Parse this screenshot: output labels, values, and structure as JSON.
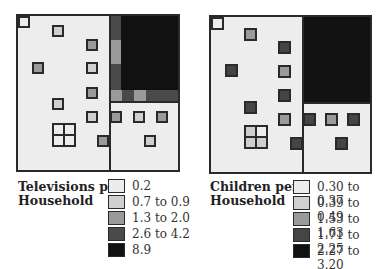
{
  "colors": {
    "tv": {
      "c1": "#ececec",
      "c2": "#cfcfcf",
      "c3": "#9a9a9a",
      "c4": "#4a4a4a",
      "c5": "#111111"
    },
    "children": {
      "c1": "#ececec",
      "c2": "#cfcfcf",
      "c3": "#9a9a9a",
      "c4": "#454545",
      "c5": "#111111"
    }
  },
  "left_map": {
    "legend_title_line1": "Televisions per",
    "legend_title_line2": "Household",
    "legend": [
      {
        "label": "0.2",
        "class": "c1"
      },
      {
        "label": "0.7 to 0.9",
        "class": "c2"
      },
      {
        "label": "1.3 to 2.0",
        "class": "c3"
      },
      {
        "label": "2.6 to 4.2",
        "class": "c4"
      },
      {
        "label": "8.9",
        "class": "c5"
      }
    ]
  },
  "right_map": {
    "legend_title_line1": "Children per",
    "legend_title_line2": "Household",
    "legend": [
      {
        "label": "0.30 to 0.37",
        "class": "c1"
      },
      {
        "label": "0.39 to 0.49",
        "class": "c2"
      },
      {
        "label": "1.53 to 1.63",
        "class": "c3"
      },
      {
        "label": "1.71 to 2.25",
        "class": "c4"
      },
      {
        "label": "2.27 to 3.20",
        "class": "c5"
      }
    ]
  }
}
